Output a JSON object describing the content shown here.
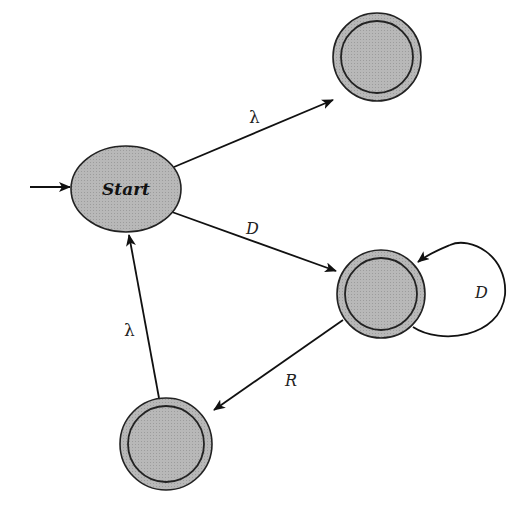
{
  "diagram": {
    "type": "finite-state-automaton",
    "states": [
      {
        "id": "start",
        "label": "Start",
        "initial": true,
        "accepting": false
      },
      {
        "id": "top_right",
        "label": "",
        "initial": false,
        "accepting": true
      },
      {
        "id": "middle_right",
        "label": "",
        "initial": false,
        "accepting": true
      },
      {
        "id": "bottom_left",
        "label": "",
        "initial": false,
        "accepting": true
      }
    ],
    "transitions": [
      {
        "from": "start",
        "to": "top_right",
        "label": "λ"
      },
      {
        "from": "start",
        "to": "middle_right",
        "label": "D"
      },
      {
        "from": "middle_right",
        "to": "middle_right",
        "label": "D"
      },
      {
        "from": "middle_right",
        "to": "bottom_left",
        "label": "R"
      },
      {
        "from": "bottom_left",
        "to": "start",
        "label": "λ"
      }
    ],
    "colors": {
      "state_fill": "#b4b4b4",
      "stroke": "#222222",
      "background": "#ffffff"
    }
  }
}
